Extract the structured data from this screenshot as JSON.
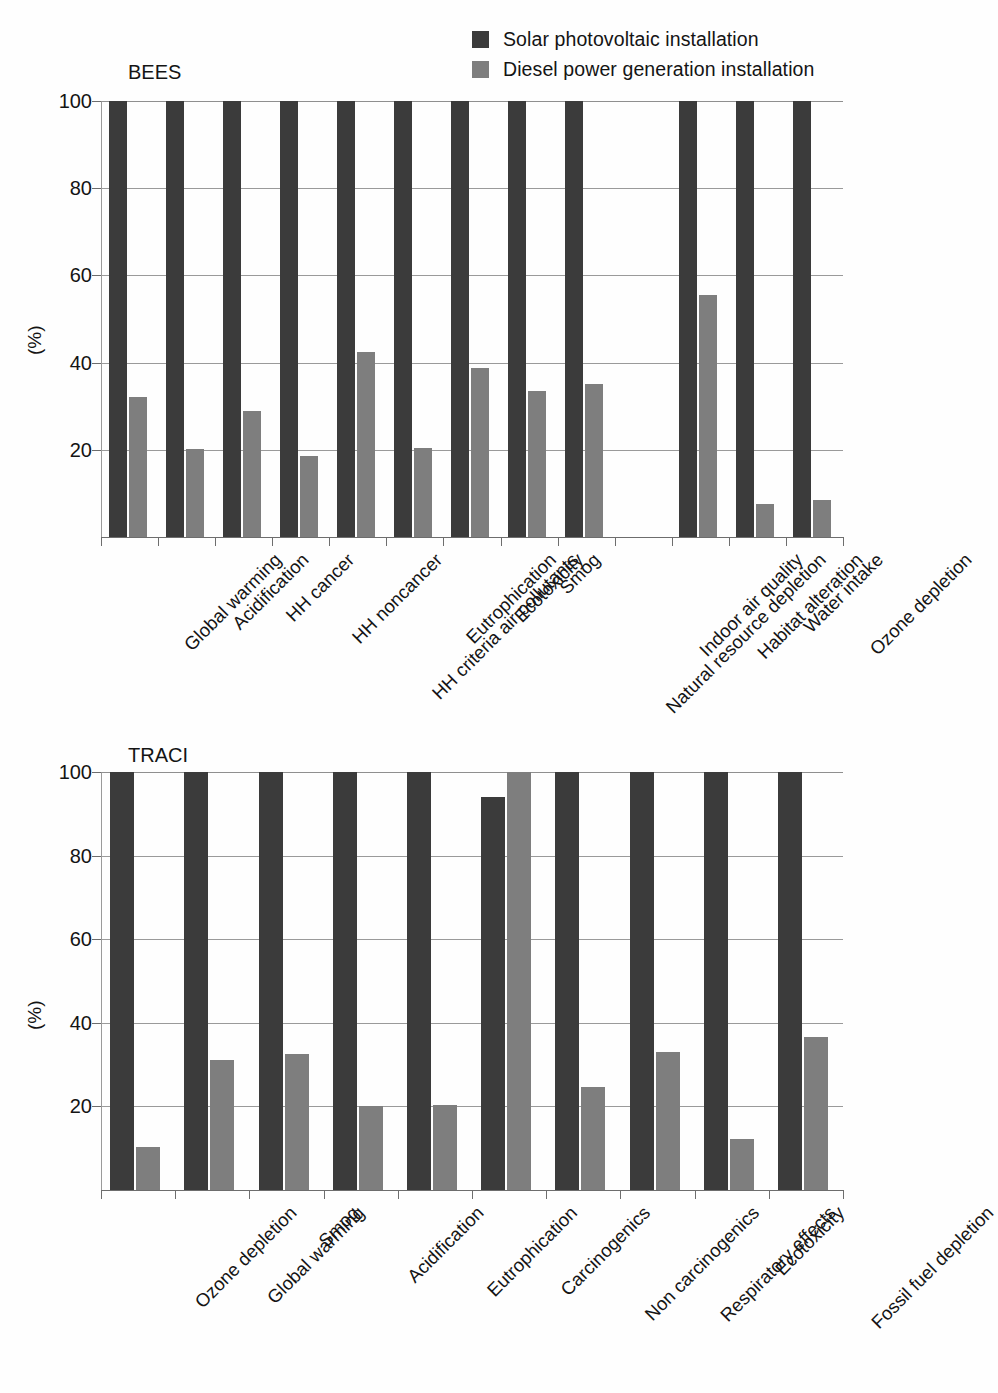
{
  "legend": {
    "position": "top-right",
    "items": [
      {
        "label": "Solar photovoltaic installation",
        "color": "#3b3b3b",
        "key": "solar"
      },
      {
        "label": "Diesel power generation installation",
        "color": "#7e7e7e",
        "key": "diesel"
      }
    ]
  },
  "chart_data": [
    {
      "id": "bees",
      "type": "bar",
      "title": "BEES",
      "xlabel": "",
      "ylabel": "(%)",
      "ylim": [
        0,
        100
      ],
      "yticks": [
        20,
        40,
        60,
        80,
        100
      ],
      "grid": true,
      "legend_position": "top-right",
      "categories": [
        "Global warming",
        "Acidification",
        "HH cancer",
        "HH noncancer",
        "HH criteria air pollutants",
        "Eutrophication",
        "Ecotoxicity",
        "Smog",
        "Natural resource depletion",
        "Indoor air quality",
        "Habitat alteration",
        "Water intake",
        "Ozone depletion"
      ],
      "series": [
        {
          "name": "Solar photovoltaic installation",
          "color": "#3b3b3b",
          "values": [
            100,
            100,
            100,
            100,
            100,
            100,
            100,
            100,
            100,
            null,
            100,
            100,
            100
          ]
        },
        {
          "name": "Diesel power generation installation",
          "color": "#7e7e7e",
          "values": [
            32,
            20.2,
            29,
            18.5,
            42.5,
            20.4,
            38.7,
            33.6,
            35,
            null,
            55.5,
            7.5,
            8.5
          ]
        }
      ]
    },
    {
      "id": "traci",
      "type": "bar",
      "title": "TRACI",
      "xlabel": "",
      "ylabel": "(%)",
      "ylim": [
        0,
        100
      ],
      "yticks": [
        20,
        40,
        60,
        80,
        100
      ],
      "grid": true,
      "legend_position": "top-right",
      "categories": [
        "Ozone depletion",
        "Global warming",
        "Smog",
        "Acidification",
        "Eutrophication",
        "Carcinogenics",
        "Non carcinogenics",
        "Respiratory effects",
        "Ecotoxicity",
        "Fossil fuel depletion"
      ],
      "series": [
        {
          "name": "Solar photovoltaic installation",
          "color": "#3b3b3b",
          "values": [
            100,
            100,
            100,
            100,
            100,
            94,
            100,
            100,
            100,
            100
          ]
        },
        {
          "name": "Diesel power generation installation",
          "color": "#7e7e7e",
          "values": [
            10.4,
            31.2,
            32.6,
            20.2,
            20.4,
            100,
            24.6,
            33,
            12.2,
            36.5
          ]
        }
      ]
    }
  ]
}
